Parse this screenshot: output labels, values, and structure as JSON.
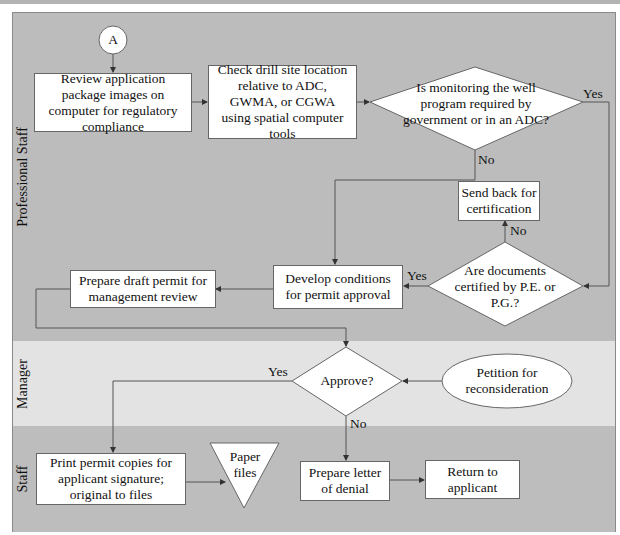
{
  "lanes": [
    {
      "label": "Professional Staff"
    },
    {
      "label": "Manager"
    },
    {
      "label": "Staff"
    }
  ],
  "connector": {
    "label": "A"
  },
  "nodes": {
    "review": {
      "type": "process",
      "text": "Review application package images on computer for regulatory compliance"
    },
    "check": {
      "type": "process",
      "text": "Check drill site location relative to ADC, GWMA, or CGWA using spatial computer tools"
    },
    "monitoring": {
      "type": "decision",
      "text": "Is monitoring the well program required by government or in an ADC?"
    },
    "send_back": {
      "type": "process",
      "text": "Send back for certification"
    },
    "certified": {
      "type": "decision",
      "text": "Are documents certified by P.E. or P.G.?"
    },
    "develop": {
      "type": "process",
      "text": "Develop conditions for permit approval"
    },
    "draft": {
      "type": "process",
      "text": "Prepare draft permit for management review"
    },
    "approve": {
      "type": "decision",
      "text": "Approve?"
    },
    "petition": {
      "type": "terminator",
      "text": "Petition for reconsideration"
    },
    "print": {
      "type": "process",
      "text": "Print permit copies for applicant signature; original to files"
    },
    "paper_files": {
      "type": "storage",
      "text": "Paper files"
    },
    "denial": {
      "type": "process",
      "text": "Prepare letter of denial"
    },
    "return": {
      "type": "process",
      "text": "Return to applicant"
    }
  },
  "edge_labels": {
    "monitoring_yes": "Yes",
    "monitoring_no": "No",
    "certified_no": "No",
    "certified_yes": "Yes",
    "approve_yes": "Yes",
    "approve_no": "No"
  },
  "colors": {
    "lane_professional": "#bcbcbc",
    "lane_manager": "#e3e3e3",
    "lane_staff": "#bdbdbd",
    "node_fill": "#ffffff",
    "line": "#555555"
  }
}
